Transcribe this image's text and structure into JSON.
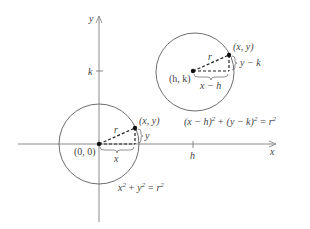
{
  "diagram": {
    "type": "circle-equations",
    "colors": {
      "axis": "#8a8a8a",
      "circle": "#6e6e6e",
      "text": "#444444",
      "dash": "#222222"
    },
    "axes": {
      "x_label": "x",
      "y_label": "y",
      "tick_h_label": "h",
      "tick_k_label": "k"
    },
    "circle_origin": {
      "center_label": "(0, 0)",
      "point_label": "(x, y)",
      "radius_label": "r",
      "horizontal_label": "x",
      "vertical_label": "y",
      "equation_lhs_a": "x",
      "equation_lhs_b": "+ y",
      "equation_rhs": "= r",
      "equation_text": "x² + y² = r²"
    },
    "circle_shifted": {
      "center_label": "(h, k)",
      "point_label": "(x, y)",
      "radius_label": "r",
      "horizontal_label": "x − h",
      "vertical_label": "y − k",
      "equation_text": "(x − h)² + (y − k)² = r²",
      "eq_part1": "(x − h)",
      "eq_part2": "+ (y − k)",
      "eq_part3": "= r"
    },
    "superscript": "2"
  }
}
